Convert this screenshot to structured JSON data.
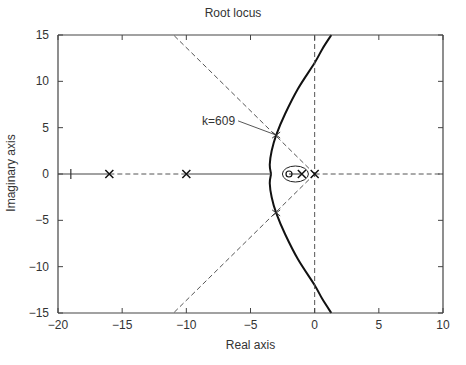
{
  "chart_data": {
    "type": "line",
    "title": "Root locus",
    "xlabel": "Real axis",
    "ylabel": "Imaginary axis",
    "xlim": [
      -20,
      10
    ],
    "ylim": [
      -15,
      15
    ],
    "xticks": [
      -20,
      -15,
      -10,
      -5,
      0,
      5,
      10
    ],
    "xtick_labels": [
      "−20",
      "−15",
      "−10",
      "−5",
      "0",
      "5",
      "10"
    ],
    "yticks": [
      15,
      10,
      5,
      0,
      -5,
      -10,
      -15
    ],
    "ytick_labels": [
      "15",
      "10",
      "5",
      "0",
      "−5",
      "−10",
      "−15"
    ],
    "grid": false,
    "poles": [
      -16,
      -10,
      -1,
      0
    ],
    "zeros": [
      -2
    ],
    "breakaway_tick": -19,
    "series": [
      {
        "name": "locus-upper-branch",
        "style": "solid-thick",
        "points": [
          [
            -3.4,
            0
          ],
          [
            -3.5,
            1
          ],
          [
            -3.35,
            2.5
          ],
          [
            -3.0,
            4.2
          ],
          [
            -2.3,
            6.5
          ],
          [
            -1.3,
            9.2
          ],
          [
            0.0,
            12.0
          ],
          [
            0.6,
            13.5
          ],
          [
            1.3,
            15
          ]
        ]
      },
      {
        "name": "locus-lower-branch",
        "style": "solid-thick",
        "points": [
          [
            -3.4,
            0
          ],
          [
            -3.5,
            -1
          ],
          [
            -3.35,
            -2.5
          ],
          [
            -3.0,
            -4.2
          ],
          [
            -2.3,
            -6.5
          ],
          [
            -1.3,
            -9.2
          ],
          [
            0.0,
            -12.0
          ],
          [
            0.6,
            -13.5
          ],
          [
            1.3,
            -15
          ]
        ]
      },
      {
        "name": "real-axis-locus",
        "style": "solid",
        "points": [
          [
            -20,
            0
          ],
          [
            -16,
            0
          ]
        ]
      },
      {
        "name": "real-axis-locus-2",
        "style": "solid",
        "points": [
          [
            -10,
            0
          ],
          [
            -3.4,
            0
          ]
        ]
      },
      {
        "name": "real-axis-locus-3",
        "style": "solid",
        "points": [
          [
            -2,
            0
          ],
          [
            -1,
            0
          ]
        ]
      },
      {
        "name": "asymptote-upper",
        "style": "dashed",
        "points": [
          [
            0,
            0
          ],
          [
            -11,
            15
          ]
        ]
      },
      {
        "name": "asymptote-lower",
        "style": "dashed",
        "points": [
          [
            0,
            0
          ],
          [
            -11,
            -15
          ]
        ]
      },
      {
        "name": "real-axis-dashed-left",
        "style": "dashed",
        "points": [
          [
            -16,
            0
          ],
          [
            -10,
            0
          ]
        ]
      },
      {
        "name": "real-axis-dashed-right",
        "style": "dashed",
        "points": [
          [
            0,
            0
          ],
          [
            10,
            0
          ]
        ]
      },
      {
        "name": "imag-axis-dashed",
        "style": "dashed",
        "points": [
          [
            0,
            -15
          ],
          [
            0,
            15
          ]
        ]
      }
    ],
    "annotations": [
      {
        "text": "k=609",
        "label_at": [
          -6.2,
          5.3
        ],
        "arrow_to": [
          -3.0,
          4.2
        ],
        "mirror_tick": [
          -3.0,
          -4.2
        ]
      }
    ]
  }
}
